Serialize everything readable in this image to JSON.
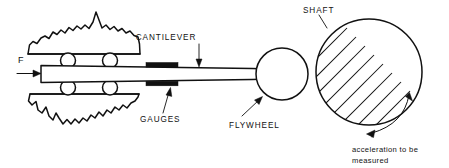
{
  "figure": {
    "type": "engineering-schematic",
    "background_color": "#ffffff",
    "line_color": "#111111"
  },
  "labels": {
    "force": "F",
    "cantilever": "CANTILEVER",
    "gauges": "GAUGES",
    "flywheel": "FLYWHEEL",
    "shaft": "SHAFT",
    "acceleration_line1": "acceleration to be",
    "acceleration_line2": "measured"
  },
  "parts": {
    "force_arrow": "force-arrow",
    "upper_support": "broken-away-upper-support-block",
    "lower_support": "broken-away-lower-support-block",
    "rollers": [
      "roller-upper-left",
      "roller-upper-right",
      "roller-lower-left",
      "roller-lower-right"
    ],
    "beam": "tapered-cantilever-beam",
    "gauge_upper": "strain-gauge-upper",
    "gauge_lower": "strain-gauge-lower",
    "pin_hole": "beam-pin-hole",
    "flywheel": "flywheel-circle",
    "shaft": "hatched-shaft-circle",
    "rotation_arrow": "double-headed-rotation-arrow"
  },
  "geometry": {
    "canvas_width": 449,
    "canvas_height": 168,
    "flywheel": {
      "cx": 282,
      "cy": 74,
      "r": 26
    },
    "shaft": {
      "cx": 369,
      "cy": 72,
      "r": 53
    },
    "pin_hole": {
      "cx": 283,
      "cy": 74,
      "r": 3.2
    },
    "beam": {
      "x_left": 41,
      "x_right": 292,
      "y_top": 66,
      "y_bottom": 82
    },
    "rollers_radius": 7.5,
    "hatch_angle_deg": 45,
    "hatch_spacing": 13
  }
}
